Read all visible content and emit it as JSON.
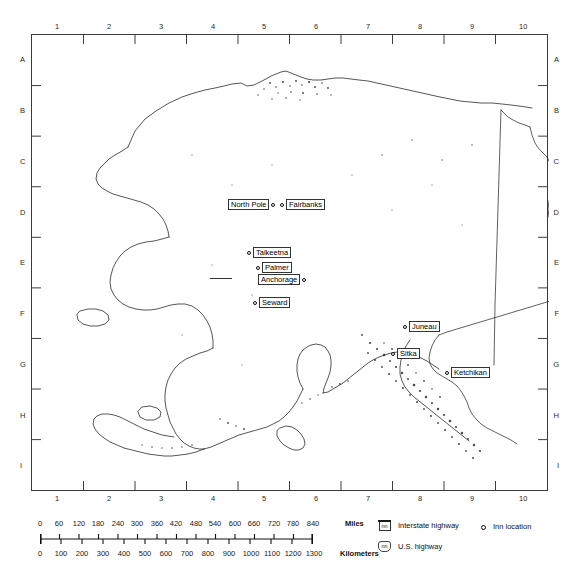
{
  "map": {
    "title": "Alaska",
    "grid": {
      "columns": [
        "1",
        "2",
        "3",
        "4",
        "5",
        "6",
        "7",
        "8",
        "9",
        "10"
      ],
      "rows": [
        "A",
        "B",
        "C",
        "D",
        "E",
        "F",
        "G",
        "H",
        "I"
      ]
    },
    "cities": [
      {
        "name": "North Pole",
        "label_side": "left",
        "x": 276,
        "y": 203
      },
      {
        "name": "Fairbanks",
        "label_side": "right",
        "x": 282,
        "y": 203
      },
      {
        "name": "Talkeetna",
        "label_side": "right",
        "x": 249,
        "y": 251
      },
      {
        "name": "Palmer",
        "label_side": "right",
        "x": 258,
        "y": 266
      },
      {
        "name": "Anchorage",
        "label_side": "left",
        "x": 253,
        "y": 277
      },
      {
        "name": "Seward",
        "label_side": "right",
        "x": 254,
        "y": 300
      },
      {
        "name": "Juneau",
        "label_side": "right",
        "x": 404,
        "y": 324
      },
      {
        "name": "Sitka",
        "label_side": "right",
        "x": 392,
        "y": 351
      },
      {
        "name": "Ketchikan",
        "label_side": "right",
        "x": 446,
        "y": 370
      }
    ]
  },
  "scale": {
    "miles": {
      "unit_label": "Miles",
      "ticks": [
        "0",
        "60",
        "120",
        "180",
        "240",
        "300",
        "360",
        "420",
        "480",
        "540",
        "600",
        "660",
        "720",
        "780",
        "840"
      ]
    },
    "kilometers": {
      "unit_label": "Kilometers",
      "ticks": [
        "0",
        "100",
        "200",
        "300",
        "400",
        "500",
        "600",
        "700",
        "800",
        "900",
        "1000",
        "1100",
        "1200",
        "1300"
      ]
    }
  },
  "legend": {
    "items": [
      {
        "symbol": "interstate-shield",
        "shield_text": "nn",
        "label": "Interstate highway"
      },
      {
        "symbol": "us-highway-shield",
        "shield_text": "nn",
        "label": "U.S. highway"
      },
      {
        "symbol": "inn-circle",
        "shield_text": "",
        "label": "Inn location"
      }
    ]
  }
}
